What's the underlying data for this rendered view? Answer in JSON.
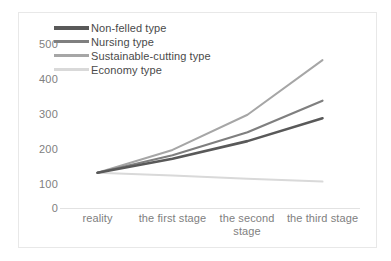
{
  "chart_data": {
    "type": "line",
    "title": "",
    "subtitle": "",
    "xlabel": "",
    "ylabel": "",
    "categories": [
      "reality",
      "the first stage",
      "the second stage",
      "the third stage"
    ],
    "series": [
      {
        "name": "Non-felled type",
        "color": "#595959",
        "line_width": 2.6,
        "values": [
          100,
          140,
          190,
          255
        ]
      },
      {
        "name": "Nursing type",
        "color": "#7f7f7f",
        "line_width": 2.2,
        "values": [
          100,
          150,
          215,
          305
        ]
      },
      {
        "name": "Sustainable-cutting type",
        "color": "#a6a6a6",
        "line_width": 2.0,
        "values": [
          100,
          165,
          265,
          420
        ]
      },
      {
        "name": "Economy type",
        "color": "#d9d9d9",
        "line_width": 2.0,
        "values": [
          100,
          92,
          83,
          75
        ]
      }
    ],
    "ylim": [
      0,
      500
    ],
    "y_ticks": [
      0,
      100,
      200,
      300,
      400,
      500
    ],
    "y_tick_labels": [
      "0",
      "100",
      "200",
      "300",
      "400",
      "500"
    ],
    "grid": false,
    "legend_position": "top-left",
    "axis_color": "#e2e2e2",
    "tick_label_color": "#808080",
    "legend_label_color": "#4a4a4a",
    "frame_color": "#e8e8e8",
    "background": "#ffffff"
  }
}
